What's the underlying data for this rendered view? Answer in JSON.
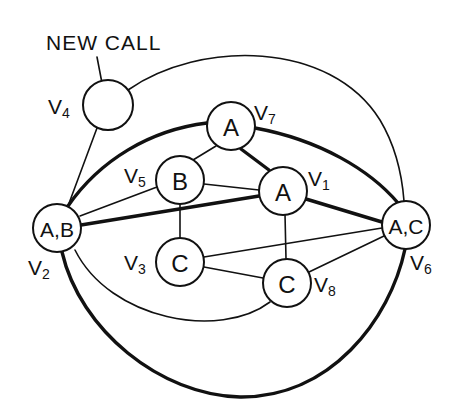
{
  "annotation": {
    "text": "NEW CALL",
    "points_to": "V4"
  },
  "nodes": [
    {
      "id": "V1",
      "label": "A",
      "vertex": "V",
      "sub": "1"
    },
    {
      "id": "V2",
      "label": "A,B",
      "vertex": "V",
      "sub": "2"
    },
    {
      "id": "V3",
      "label": "C",
      "vertex": "V",
      "sub": "3"
    },
    {
      "id": "V4",
      "label": "",
      "vertex": "V",
      "sub": "4"
    },
    {
      "id": "V5",
      "label": "B",
      "vertex": "V",
      "sub": "5"
    },
    {
      "id": "V6",
      "label": "A,C",
      "vertex": "V",
      "sub": "6"
    },
    {
      "id": "V7",
      "label": "A",
      "vertex": "V",
      "sub": "7"
    },
    {
      "id": "V8",
      "label": "C",
      "vertex": "V",
      "sub": "8"
    }
  ],
  "edges": [
    {
      "from": "V4",
      "to": "V6",
      "weight": "thin",
      "shape": "arc"
    },
    {
      "from": "V4",
      "to": "V2",
      "weight": "thin",
      "shape": "line"
    },
    {
      "from": "V2",
      "to": "V7",
      "weight": "thick",
      "shape": "arc"
    },
    {
      "from": "V7",
      "to": "V6",
      "weight": "thick",
      "shape": "arc"
    },
    {
      "from": "V7",
      "to": "V5",
      "weight": "thin",
      "shape": "line"
    },
    {
      "from": "V7",
      "to": "V1",
      "weight": "thick",
      "shape": "line"
    },
    {
      "from": "V5",
      "to": "V2",
      "weight": "thin",
      "shape": "line"
    },
    {
      "from": "V5",
      "to": "V1",
      "weight": "thin",
      "shape": "line"
    },
    {
      "from": "V5",
      "to": "V3",
      "weight": "thin",
      "shape": "line"
    },
    {
      "from": "V2",
      "to": "V1",
      "weight": "thick",
      "shape": "line"
    },
    {
      "from": "V1",
      "to": "V6",
      "weight": "thick",
      "shape": "line"
    },
    {
      "from": "V1",
      "to": "V8",
      "weight": "thin",
      "shape": "line"
    },
    {
      "from": "V3",
      "to": "V6",
      "weight": "thin",
      "shape": "line"
    },
    {
      "from": "V3",
      "to": "V8",
      "weight": "thin",
      "shape": "line"
    },
    {
      "from": "V8",
      "to": "V6",
      "weight": "thin",
      "shape": "line"
    },
    {
      "from": "V2",
      "to": "V8",
      "weight": "thin",
      "shape": "arc"
    },
    {
      "from": "V2",
      "to": "V6",
      "weight": "thick",
      "shape": "arc-bottom"
    }
  ],
  "colors": {
    "ink": "#111111",
    "background": "#ffffff"
  }
}
